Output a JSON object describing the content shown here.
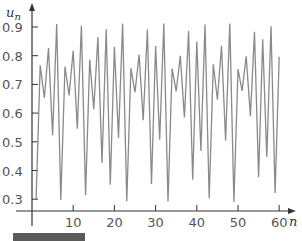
{
  "chart_data": {
    "type": "line",
    "title": "",
    "xlabel": "n",
    "ylabel": "u_n",
    "xlim": [
      0,
      62
    ],
    "ylim": [
      0.25,
      0.93
    ],
    "x_ticks": [
      10,
      20,
      30,
      40,
      50,
      60
    ],
    "x_tick_labels": [
      "10",
      "20",
      "30",
      "40",
      "50",
      "60"
    ],
    "y_ticks": [
      0.3,
      0.4,
      0.5,
      0.6,
      0.7,
      0.8,
      0.9
    ],
    "y_tick_labels": [
      "0.3",
      "0.4",
      "0.5",
      "0.6",
      "0.7",
      "0.8",
      "0.9"
    ],
    "grid": false,
    "legend": null,
    "line_color": "#8a8a8a",
    "series": [
      {
        "name": "u_n",
        "x": [
          1,
          2,
          3,
          4,
          5,
          6,
          7,
          8,
          9,
          10,
          11,
          12,
          13,
          14,
          15,
          16,
          17,
          18,
          19,
          20,
          21,
          22,
          23,
          24,
          25,
          26,
          27,
          28,
          29,
          30,
          31,
          32,
          33,
          34,
          35,
          36,
          37,
          38,
          39,
          40,
          41,
          42,
          43,
          44,
          45,
          46,
          47,
          48,
          49,
          50,
          51,
          52,
          53,
          54,
          55,
          56,
          57,
          58,
          59,
          60
        ],
        "values": [
          0.3,
          0.7665,
          0.6533,
          0.8267,
          0.5229,
          0.9106,
          0.2971,
          0.7622,
          0.6616,
          0.8172,
          0.5453,
          0.905,
          0.3138,
          0.786,
          0.6139,
          0.8652,
          0.4257,
          0.8924,
          0.3505,
          0.8309,
          0.5129,
          0.9119,
          0.2932,
          0.7564,
          0.6726,
          0.8038,
          0.5756,
          0.8916,
          0.3528,
          0.8334,
          0.5068,
          0.9123,
          0.292,
          0.7546,
          0.6759,
          0.7996,
          0.5849,
          0.8862,
          0.3681,
          0.849,
          0.4679,
          0.9088,
          0.3025,
          0.7701,
          0.6462,
          0.8345,
          0.5041,
          0.9125,
          0.2914,
          0.7537,
          0.6776,
          0.7974,
          0.5897,
          0.8831,
          0.3768,
          0.8571,
          0.4471,
          0.9023,
          0.3218,
          0.7966
        ]
      }
    ]
  },
  "labels": {
    "y_axis_var": "u",
    "y_axis_sub": "n",
    "x_axis_var": "n"
  }
}
